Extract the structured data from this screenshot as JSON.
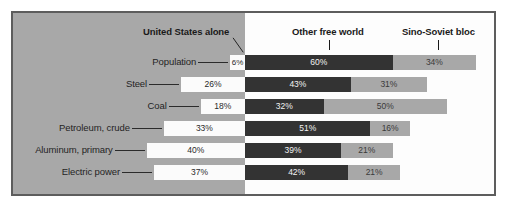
{
  "figure": {
    "background_color": "#ffffff",
    "panel_left_color": "#a8a8a8",
    "panel_right_color": "#fdfdfd",
    "frame_color": "#5d5d5d"
  },
  "legend": {
    "series": [
      {
        "key": "us",
        "label": "United States alone",
        "color": "#fbfbfb",
        "leader": "diagonal"
      },
      {
        "key": "other",
        "label": "Other free world",
        "color": "#333333",
        "leader": "vertical"
      },
      {
        "key": "sino",
        "label": "Sino-Soviet bloc",
        "color": "#a8a8a8",
        "leader": "vertical"
      }
    ]
  },
  "chart_data": {
    "type": "bar",
    "orientation": "horizontal",
    "stacked": true,
    "title": "",
    "subtitle": "",
    "xlabel": "",
    "ylabel": "",
    "xlim": [
      0,
      100
    ],
    "grid": false,
    "legend_position": "top",
    "unit": "%",
    "categories": [
      "Population",
      "Steel",
      "Coal",
      "Petroleum, crude",
      "Aluminum, primary",
      "Electric power"
    ],
    "series": [
      {
        "name": "United States alone",
        "color": "#fbfbfb",
        "values": [
          6,
          26,
          18,
          33,
          40,
          37
        ]
      },
      {
        "name": "Other free world",
        "color": "#333333",
        "values": [
          60,
          43,
          32,
          51,
          39,
          42
        ]
      },
      {
        "name": "Sino-Soviet bloc",
        "color": "#a8a8a8",
        "values": [
          34,
          31,
          50,
          16,
          21,
          21
        ]
      }
    ],
    "value_labels": {
      "Population": {
        "us": "6%",
        "other": "60%",
        "sino": "34%"
      },
      "Steel": {
        "us": "26%",
        "other": "43%",
        "sino": "31%"
      },
      "Coal": {
        "us": "18%",
        "other": "32%",
        "sino": "50%"
      },
      "Petroleum, crude": {
        "us": "33%",
        "other": "51%",
        "sino": "16%"
      },
      "Aluminum, primary": {
        "us": "40%",
        "other": "39%",
        "sino": "21%"
      },
      "Electric power": {
        "us": "37%",
        "other": "42%",
        "sino": "21%"
      }
    }
  },
  "rows": [
    {
      "label": "Population",
      "us": "6%",
      "other": "60%",
      "sino": "34%"
    },
    {
      "label": "Steel",
      "us": "26%",
      "other": "43%",
      "sino": "31%"
    },
    {
      "label": "Coal",
      "us": "18%",
      "other": "32%",
      "sino": "50%"
    },
    {
      "label": "Petroleum, crude",
      "us": "33%",
      "other": "51%",
      "sino": "16%"
    },
    {
      "label": "Aluminum, primary",
      "us": "40%",
      "other": "39%",
      "sino": "21%"
    },
    {
      "label": "Electric power",
      "us": "37%",
      "other": "42%",
      "sino": "21%"
    }
  ]
}
